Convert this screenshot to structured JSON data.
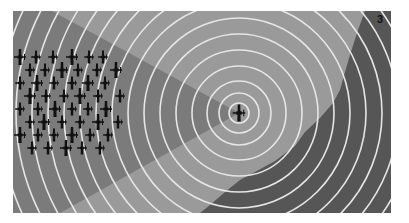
{
  "illustration": {
    "panel_number": "3",
    "subject": "radar-rings-around-single-aircraft-with-bomber-formation",
    "colors": {
      "background": "#ffffff",
      "light_zone": "#9a9a9a",
      "wedge_zone": "#7b7b7b",
      "terrain_zone": "#565656",
      "rings": "#e8e8e8",
      "aircraft": "#111111"
    },
    "center": {
      "x": 226,
      "y": 102
    },
    "ring_radii": [
      10,
      20,
      32,
      47,
      63,
      79,
      95,
      111,
      127,
      143,
      159,
      175,
      191,
      207,
      223,
      239,
      255,
      271
    ],
    "formation": {
      "rows": 8,
      "description": "approx 40 aircraft in loose grid formation on left side"
    }
  }
}
